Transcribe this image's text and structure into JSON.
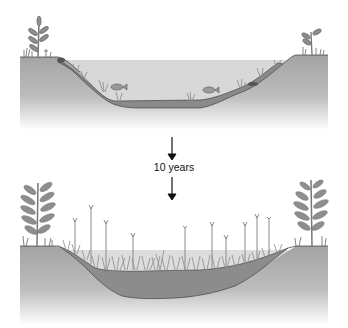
{
  "diagram": {
    "type": "pond succession",
    "panels": [
      {
        "id": "before",
        "description": "Open pond with water, fish, submerged plants, turtle, shoreline plants"
      },
      {
        "id": "after",
        "description": "Pond filled with sediment and marsh vegetation, larger shoreline shrubs"
      }
    ],
    "transition_label": "10 years",
    "colors": {
      "ground": "#a9a9a9",
      "ground_fade": "#f4f4f4",
      "water": "#d6d6d6",
      "sediment": "#7f7f7f",
      "plant": "#8c8c8c",
      "outline": "#333333",
      "arrow": "#111111"
    }
  }
}
